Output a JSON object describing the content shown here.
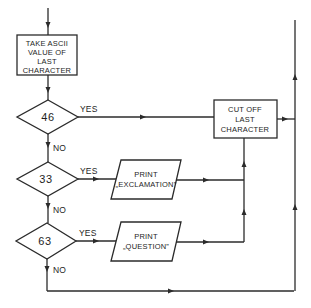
{
  "diagram": {
    "type": "flowchart",
    "colors": {
      "stroke": "#2b2b2b",
      "background": "#ffffff",
      "text": "#1e1e1e"
    },
    "process_ascii": {
      "lines": [
        "TAKE ASCII",
        "VALUE OF",
        "LAST",
        "CHARACTER"
      ]
    },
    "decision_46": {
      "value": "46",
      "yes_label": "YES",
      "no_label": "NO"
    },
    "decision_33": {
      "value": "33",
      "yes_label": "YES",
      "no_label": "NO"
    },
    "decision_63": {
      "value": "63",
      "yes_label": "YES",
      "no_label": "NO"
    },
    "process_cutoff": {
      "lines": [
        "CUT OFF",
        "LAST",
        "CHARACTER"
      ]
    },
    "output_exclamation": {
      "lines": [
        "PRINT",
        "„EXCLAMATION”"
      ]
    },
    "output_question": {
      "lines": [
        "PRINT",
        "„QUESTION”"
      ]
    }
  }
}
